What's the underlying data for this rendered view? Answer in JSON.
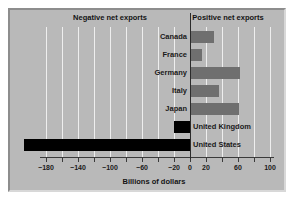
{
  "chart_data": {
    "type": "bar",
    "orientation": "horizontal",
    "title": "",
    "xlabel": "Billions of dollars",
    "ylabel": "",
    "xlim": [
      -200,
      110
    ],
    "xticks": [
      -200,
      -180,
      -160,
      -140,
      -120,
      -100,
      -80,
      -60,
      -40,
      -20,
      0,
      20,
      40,
      60,
      80,
      100
    ],
    "xtick_labels": [
      "",
      "−180",
      "",
      "−140",
      "",
      "−100",
      "",
      "−60",
      "",
      "−20",
      "0",
      "20",
      "",
      "60",
      "",
      "100"
    ],
    "grid": true,
    "grid_axis": "x",
    "grid_step": 20,
    "legend": null,
    "categories": [
      "Canada",
      "France",
      "Germany",
      "Italy",
      "Japan",
      "United Kingdom",
      "United States"
    ],
    "values": [
      30,
      15,
      63,
      36,
      61,
      -20,
      -208
    ],
    "annotations": {
      "left_heading": "Negative net exports",
      "right_heading": "Positive net exports"
    },
    "colors": {
      "positive_bar": "#6f6f6f",
      "negative_bar": "#000000",
      "panel_background": "#b9b9b9",
      "gridline": "#eeeeee",
      "axis": "#3a3a3a",
      "zero_line": "#2b2b2b",
      "text": "#1a1a1a"
    },
    "bars": [
      {
        "label": "Canada",
        "value": 30,
        "sign": "positive",
        "label_side": "left"
      },
      {
        "label": "France",
        "value": 15,
        "sign": "positive",
        "label_side": "left"
      },
      {
        "label": "Germany",
        "value": 63,
        "sign": "positive",
        "label_side": "left"
      },
      {
        "label": "Italy",
        "value": 36,
        "sign": "positive",
        "label_side": "left"
      },
      {
        "label": "Japan",
        "value": 61,
        "sign": "positive",
        "label_side": "left"
      },
      {
        "label": "United Kingdom",
        "value": -20,
        "sign": "negative",
        "label_side": "right"
      },
      {
        "label": "United States",
        "value": -208,
        "sign": "negative",
        "label_side": "right"
      }
    ]
  }
}
